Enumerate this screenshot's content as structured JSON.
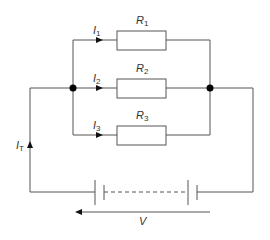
{
  "diagram": {
    "type": "parallel-resistor-circuit",
    "resistors": [
      {
        "label": "R",
        "sub": "1"
      },
      {
        "label": "R",
        "sub": "2"
      },
      {
        "label": "R",
        "sub": "3"
      }
    ],
    "currents": [
      {
        "label": "I",
        "sub": "1"
      },
      {
        "label": "I",
        "sub": "2"
      },
      {
        "label": "I",
        "sub": "3"
      },
      {
        "label": "I",
        "sub": "T"
      }
    ],
    "voltage": {
      "label": "V"
    },
    "colors": {
      "wire": "#555555",
      "node": "#000000",
      "text": "#333333"
    }
  }
}
